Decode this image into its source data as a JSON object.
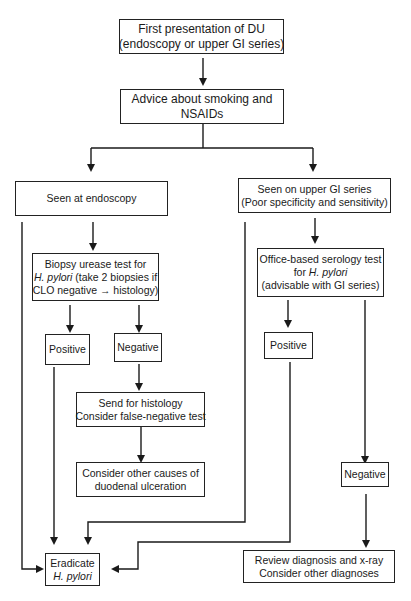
{
  "diagram": {
    "type": "flowchart",
    "nodes": {
      "first_presentation": {
        "line1": "First presentation of DU",
        "line2": "(endoscopy or upper GI series)"
      },
      "advice": {
        "line1": "Advice about smoking and",
        "line2": "NSAIDs"
      },
      "seen_endoscopy": {
        "line1": "Seen at endoscopy"
      },
      "seen_upper_gi": {
        "line1": "Seen on upper GI series",
        "line2": "(Poor specificity and sensitivity)"
      },
      "biopsy_urease": {
        "line1": "Biopsy urease test for",
        "line2_italic": "H. pylori",
        "line2_rest": " (take 2 biopsies if",
        "line3": "CLO negative → histology)"
      },
      "endo_positive": {
        "line1": "Positive"
      },
      "endo_negative": {
        "line1": "Negative"
      },
      "send_histology": {
        "line1": "Send for histology",
        "line2": "Consider false-negative test"
      },
      "other_causes": {
        "line1": "Consider other causes of",
        "line2": "duodenal ulceration"
      },
      "serology": {
        "line1": "Office-based serology test",
        "line2_prefix": "for ",
        "line2_italic": "H. pylori",
        "line3": "(advisable with GI series)"
      },
      "sero_positive": {
        "line1": "Positive"
      },
      "sero_negative": {
        "line1": "Negative"
      },
      "eradicate": {
        "line1": "Eradicate",
        "line2_italic": "H. pylori"
      },
      "review": {
        "line1": "Review diagnosis and x-ray",
        "line2": "Consider other diagnoses"
      }
    },
    "edges": [
      [
        "first_presentation",
        "advice"
      ],
      [
        "advice",
        "seen_endoscopy"
      ],
      [
        "advice",
        "seen_upper_gi"
      ],
      [
        "seen_endoscopy",
        "biopsy_urease"
      ],
      [
        "seen_endoscopy",
        "eradicate"
      ],
      [
        "biopsy_urease",
        "endo_positive"
      ],
      [
        "biopsy_urease",
        "endo_negative"
      ],
      [
        "endo_positive",
        "eradicate"
      ],
      [
        "endo_negative",
        "send_histology"
      ],
      [
        "send_histology",
        "other_causes"
      ],
      [
        "seen_upper_gi",
        "serology"
      ],
      [
        "seen_upper_gi",
        "eradicate"
      ],
      [
        "serology",
        "sero_positive"
      ],
      [
        "serology",
        "sero_negative"
      ],
      [
        "sero_positive",
        "eradicate"
      ],
      [
        "sero_negative",
        "review"
      ]
    ]
  }
}
